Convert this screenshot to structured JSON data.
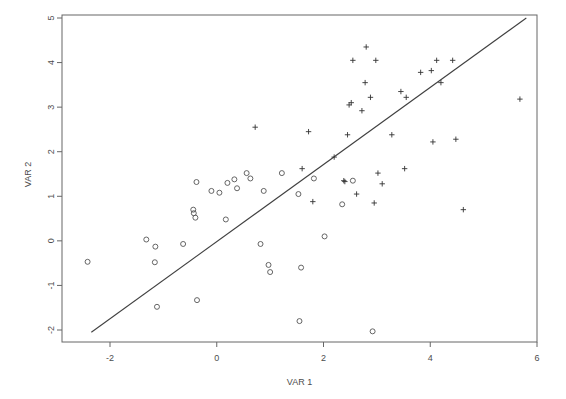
{
  "chart_data": {
    "type": "scatter",
    "title": "",
    "xlabel": "VAR 1",
    "ylabel": "VAR 2",
    "xlim": [
      -2.75,
      5.95
    ],
    "ylim": [
      -2.25,
      5.2
    ],
    "xticks": [
      -2,
      0,
      2,
      4,
      6
    ],
    "xtick_labels": [
      "-2",
      "0",
      "2",
      "4",
      "6"
    ],
    "yticks": [
      -2,
      -1,
      0,
      1,
      2,
      3,
      4,
      5
    ],
    "ytick_labels": [
      "-2",
      "-1",
      "0",
      "1",
      "2",
      "3",
      "4",
      "5"
    ],
    "grid": false,
    "legend": null,
    "legend_position": "none",
    "reference_line": {
      "name": "identity-line",
      "kind": "line",
      "from": [
        -2.35,
        -2.05
      ],
      "to": [
        5.8,
        5.0
      ],
      "color": "#404040"
    },
    "series": [
      {
        "name": "group-circle",
        "marker": "open-circle",
        "color": "#555555",
        "points": [
          [
            -2.42,
            -0.47
          ],
          [
            -1.32,
            0.03
          ],
          [
            -1.15,
            -0.13
          ],
          [
            -1.16,
            -0.48
          ],
          [
            -1.12,
            -1.48
          ],
          [
            -0.63,
            -0.07
          ],
          [
            -0.43,
            0.62
          ],
          [
            -0.4,
            0.52
          ],
          [
            -0.44,
            0.7
          ],
          [
            -0.38,
            1.32
          ],
          [
            -0.37,
            -1.33
          ],
          [
            -0.1,
            1.12
          ],
          [
            0.05,
            1.08
          ],
          [
            0.17,
            0.48
          ],
          [
            0.2,
            1.3
          ],
          [
            0.33,
            1.38
          ],
          [
            0.38,
            1.18
          ],
          [
            0.56,
            1.52
          ],
          [
            0.63,
            1.4
          ],
          [
            0.82,
            -0.07
          ],
          [
            0.88,
            1.12
          ],
          [
            0.97,
            -0.54
          ],
          [
            1.0,
            -0.7
          ],
          [
            1.22,
            1.52
          ],
          [
            1.53,
            1.05
          ],
          [
            1.55,
            -1.8
          ],
          [
            1.58,
            -0.6
          ],
          [
            1.82,
            1.4
          ],
          [
            2.02,
            0.1
          ],
          [
            2.35,
            0.82
          ],
          [
            2.55,
            1.35
          ],
          [
            2.92,
            -2.03
          ]
        ]
      },
      {
        "name": "group-plus",
        "marker": "plus",
        "color": "#333333",
        "points": [
          [
            0.72,
            2.55
          ],
          [
            1.6,
            1.62
          ],
          [
            1.72,
            2.45
          ],
          [
            1.8,
            0.88
          ],
          [
            2.2,
            1.88
          ],
          [
            2.38,
            1.35
          ],
          [
            2.4,
            1.33
          ],
          [
            2.45,
            2.38
          ],
          [
            2.48,
            3.05
          ],
          [
            2.52,
            3.1
          ],
          [
            2.55,
            4.05
          ],
          [
            2.62,
            1.05
          ],
          [
            2.72,
            2.92
          ],
          [
            2.78,
            3.55
          ],
          [
            2.8,
            4.35
          ],
          [
            2.88,
            3.22
          ],
          [
            2.95,
            0.85
          ],
          [
            2.98,
            4.05
          ],
          [
            3.02,
            1.52
          ],
          [
            3.1,
            1.28
          ],
          [
            3.28,
            2.38
          ],
          [
            3.45,
            3.35
          ],
          [
            3.52,
            1.62
          ],
          [
            3.55,
            3.22
          ],
          [
            3.82,
            3.78
          ],
          [
            4.02,
            3.82
          ],
          [
            4.05,
            2.22
          ],
          [
            4.12,
            4.05
          ],
          [
            4.2,
            3.55
          ],
          [
            4.42,
            4.05
          ],
          [
            4.48,
            2.28
          ],
          [
            4.62,
            0.7
          ],
          [
            5.68,
            3.18
          ]
        ]
      }
    ]
  }
}
